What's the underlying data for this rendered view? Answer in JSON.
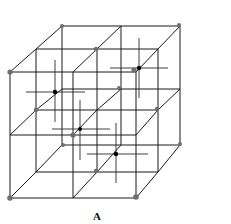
{
  "figure": {
    "label": "A",
    "colors": {
      "edge": "#1a1a1a",
      "corner_atom": "#6e6e6e",
      "center_atom": "#000000",
      "background": "#ffffff"
    },
    "faces": {
      "front": {
        "x0": 10,
        "x1": 136,
        "y0": 72,
        "y1": 198,
        "xm": 73,
        "ym": 135
      },
      "middle": {
        "x0": 36,
        "x1": 158,
        "y0": 49,
        "y1": 172,
        "xm": 97,
        "ym": 110
      },
      "back": {
        "x0": 62,
        "x1": 180,
        "y0": 26,
        "y1": 145,
        "xm": 121,
        "ym": 89
      }
    },
    "corner_atoms": [
      {
        "x": 10,
        "y": 72,
        "r": 2.6
      },
      {
        "x": 62,
        "y": 26,
        "r": 2.0
      },
      {
        "x": 179,
        "y": 25,
        "r": 2.0
      },
      {
        "x": 10,
        "y": 198,
        "r": 2.8
      },
      {
        "x": 136,
        "y": 197,
        "r": 2.8
      },
      {
        "x": 180,
        "y": 144,
        "r": 2.0
      },
      {
        "x": 96,
        "y": 49,
        "r": 2.2
      },
      {
        "x": 36,
        "y": 110,
        "r": 2.2
      },
      {
        "x": 157,
        "y": 109,
        "r": 2.2
      },
      {
        "x": 119,
        "y": 88,
        "r": 2.0
      },
      {
        "x": 73,
        "y": 135,
        "r": 2.6
      },
      {
        "x": 134,
        "y": 70,
        "r": 2.6
      },
      {
        "x": 63,
        "y": 145,
        "r": 2.0
      },
      {
        "x": 96,
        "y": 171,
        "r": 2.2
      }
    ],
    "center_atoms": [
      {
        "x": 55,
        "y": 92,
        "r": 2.2,
        "h": [
          26,
          85
        ],
        "v": [
          60,
          122
        ]
      },
      {
        "x": 139,
        "y": 68,
        "r": 2.2,
        "h": [
          110,
          168
        ],
        "v": [
          38,
          98
        ]
      },
      {
        "x": 80,
        "y": 129,
        "r": 2.0,
        "h": [
          52,
          110
        ],
        "v": [
          100,
          160
        ]
      },
      {
        "x": 116,
        "y": 154,
        "r": 2.2,
        "h": [
          87,
          148
        ],
        "v": [
          123,
          183
        ]
      }
    ]
  }
}
